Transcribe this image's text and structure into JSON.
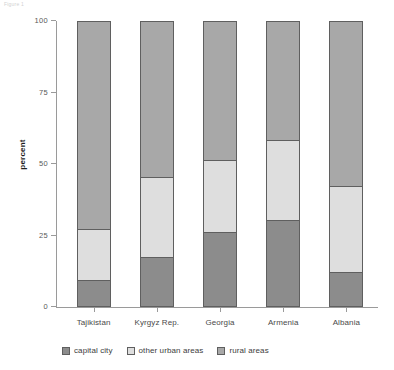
{
  "corner_caption": "Figure 1",
  "chart_data": {
    "type": "bar",
    "stacked": true,
    "title": "",
    "xlabel": "",
    "ylabel": "percent",
    "ylim": [
      0,
      100
    ],
    "yticks": [
      0,
      25,
      50,
      75,
      100
    ],
    "ytick_labels": [
      "0",
      "25",
      "50",
      "75",
      "100"
    ],
    "grid": false,
    "legend_position": "bottom-left",
    "categories": [
      "Tajikistan",
      "Kyrgyz Rep.",
      "Georgia",
      "Armenia",
      "Albania"
    ],
    "series": [
      {
        "name": "capital city",
        "color": "#8c8c8c",
        "values": [
          9,
          17,
          26,
          30,
          12
        ]
      },
      {
        "name": "other urban areas",
        "color": "#dedede",
        "values": [
          18,
          28,
          25,
          28,
          30
        ]
      },
      {
        "name": "rural areas",
        "color": "#a8a8a8",
        "values": [
          73,
          55,
          49,
          42,
          58
        ]
      }
    ],
    "cumulative_boundaries": {
      "Tajikistan": [
        9,
        27,
        100
      ],
      "Kyrgyz Rep.": [
        17,
        45,
        100
      ],
      "Georgia": [
        26,
        51,
        100
      ],
      "Armenia": [
        30,
        58,
        100
      ],
      "Albania": [
        12,
        42,
        100
      ]
    }
  }
}
